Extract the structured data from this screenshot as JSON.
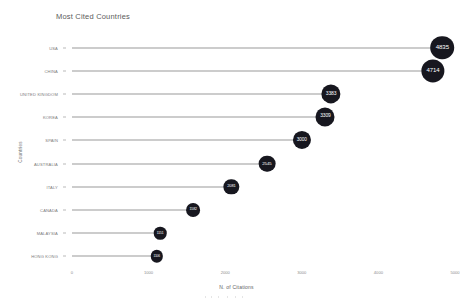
{
  "chart_data": {
    "type": "bar",
    "subtype": "lollipop",
    "title": "Most Cited Countries",
    "xlabel": "N. of Citations",
    "ylabel": "Countries",
    "xlim": [
      0,
      5000
    ],
    "ylim": null,
    "grid": false,
    "legend": null,
    "xticks": [
      "0",
      "1000",
      "2000",
      "3000",
      "4000",
      "5000"
    ],
    "xtick_values": [
      0,
      1000,
      2000,
      3000,
      4000,
      5000
    ],
    "categories": [
      "USA",
      "CHINA",
      "UNITED KINGDOM",
      "KOREA",
      "SPAIN",
      "AUSTRALIA",
      "ITALY",
      "CANADA",
      "MALAYSIA",
      "HONG KONG"
    ],
    "values": [
      4835,
      4714,
      3383,
      3309,
      3000,
      2545,
      2081,
      1582,
      1151,
      1106
    ],
    "point_labels": [
      "4835",
      "4714",
      "3383",
      "3309",
      "3000",
      "2545",
      "2081",
      "1582",
      "1151",
      "1106"
    ],
    "marker_color": "#17171f",
    "stem_color": "#9a9a9a",
    "label_color": "#ffffff",
    "background": "#ffffff",
    "axis_text_color": "#7d7d7d"
  }
}
